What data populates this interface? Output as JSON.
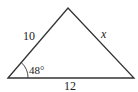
{
  "diagram": {
    "type": "triangle",
    "stroke_color": "#333333",
    "vertices": {
      "bottom_left": [
        8,
        78
      ],
      "apex": [
        68,
        8
      ],
      "bottom_right": [
        134,
        78
      ]
    },
    "labels": {
      "left_side": "10",
      "right_side": "x",
      "base": "12",
      "angle": "48°"
    }
  }
}
